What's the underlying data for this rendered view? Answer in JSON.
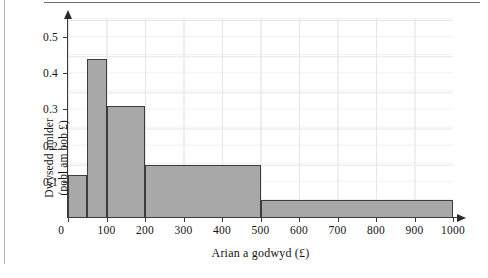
{
  "chart_data": {
    "type": "bar",
    "subtype": "histogram",
    "title": "",
    "xlabel": "Arian a godwyd (£)",
    "ylabel_line1": "Dwysedd amlder",
    "ylabel_line2": "(pobl am bob £)",
    "xlim": [
      0,
      1000
    ],
    "ylim": [
      0,
      0.552
    ],
    "grid": true,
    "legend": "none",
    "xticks": [
      0,
      100,
      200,
      300,
      400,
      500,
      600,
      700,
      800,
      900,
      1000
    ],
    "xtick_labels": [
      "0",
      "100",
      "200",
      "300",
      "400",
      "500",
      "600",
      "700",
      "800",
      "900",
      "1000"
    ],
    "yticks": [
      0.1,
      0.2,
      0.3,
      0.4,
      0.5
    ],
    "ytick_labels": [
      "0.1",
      "0.2",
      "0.3",
      "0.4",
      "0.5"
    ],
    "bar_fill_color": "#a8a8a8",
    "bar_edge_color": "#3c3c3c",
    "bins": [
      {
        "x0": 0,
        "x1": 50,
        "density": 0.12
      },
      {
        "x0": 50,
        "x1": 100,
        "density": 0.44
      },
      {
        "x0": 100,
        "x1": 200,
        "density": 0.31
      },
      {
        "x0": 200,
        "x1": 500,
        "density": 0.145
      },
      {
        "x0": 500,
        "x1": 1000,
        "density": 0.05
      }
    ]
  }
}
